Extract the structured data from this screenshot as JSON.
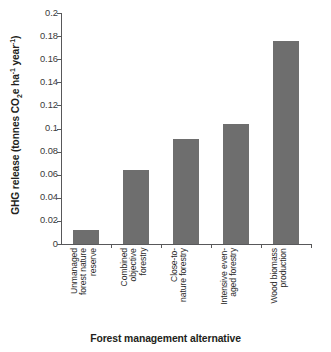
{
  "chart_data": {
    "type": "bar",
    "title": "",
    "subtitle": "",
    "xlabel": "Forest management alternative",
    "ylabel": "GHG release (tonnes CO2e ha-1 year-1)",
    "ylabel_parts": {
      "prefix": "GHG release (tonnes CO",
      "sub1": "2",
      "mid": "e ha",
      "sup1": "-1",
      "mid2": " year",
      "sup2": "-1",
      "suffix": ")"
    },
    "categories": [
      "Unmanaged\nforest nature\nreserve",
      "Combined\nobjective\nforestry",
      "Close-to-\nnature forestry",
      "Intensive even-\naged forestry",
      "Wood biomass\nproduction"
    ],
    "categories_flat": [
      "Unmanaged forest nature reserve",
      "Combined objective forestry",
      "Close-to-nature forestry",
      "Intensive even-aged forestry",
      "Wood biomass production"
    ],
    "values": [
      0.0125,
      0.064,
      0.091,
      0.104,
      0.176
    ],
    "ylim": [
      0,
      0.2
    ],
    "ytick_values": [
      0,
      0.02,
      0.04,
      0.06,
      0.08,
      0.1,
      0.12,
      0.14,
      0.16,
      0.18,
      0.2
    ],
    "ytick_labels": [
      "0",
      "0.02",
      "0.04",
      "0.06",
      "0.08",
      "0.1",
      "0.12",
      "0.14",
      "0.16",
      "0.18",
      "0.2"
    ],
    "grid": false,
    "legend": false,
    "legend_position": "none",
    "bar_color": "#6e6e6e",
    "axis_color": "#58585a",
    "background_color": "#ffffff"
  }
}
